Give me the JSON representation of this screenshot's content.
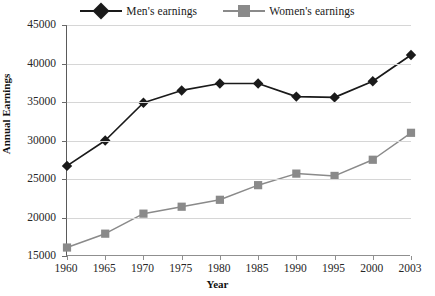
{
  "chart_data": {
    "type": "line",
    "title": "",
    "xlabel": "Year",
    "ylabel": "Annual Earnings",
    "categories": [
      "1960",
      "1965",
      "1970",
      "1975",
      "1980",
      "1985",
      "1990",
      "1995",
      "2000",
      "2003"
    ],
    "x": [
      1960,
      1965,
      1970,
      1975,
      1980,
      1985,
      1990,
      1995,
      2000,
      2003
    ],
    "series": [
      {
        "name": "Men's earnings",
        "color": "#1a1a1a",
        "marker": "diamond",
        "values": [
          26700,
          30000,
          34900,
          36500,
          37400,
          37400,
          35700,
          35600,
          37700,
          41100
        ]
      },
      {
        "name": "Women's earnings",
        "color": "#8a8a8a",
        "marker": "square",
        "values": [
          16100,
          17900,
          20500,
          21400,
          22300,
          24200,
          25700,
          25400,
          27500,
          31000
        ]
      }
    ],
    "ylim": [
      15000,
      45000
    ],
    "ytick_values": [
      15000,
      20000,
      25000,
      30000,
      35000,
      40000,
      45000
    ],
    "ytick_labels": [
      "15000",
      "20000",
      "25000",
      "30000",
      "35000",
      "40000",
      "45000"
    ],
    "grid": true,
    "grid_axis": "y",
    "legend_position": "top-center"
  },
  "legend": {
    "entries": [
      {
        "label": "Men's earnings",
        "color": "#1a1a1a",
        "marker": "diamond"
      },
      {
        "label": "Women's earnings",
        "color": "#8a8a8a",
        "marker": "square"
      }
    ]
  },
  "axes": {
    "y_title": "Annual Earnings",
    "x_title": "Year"
  }
}
